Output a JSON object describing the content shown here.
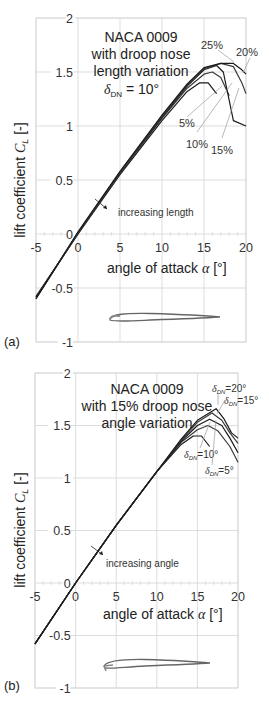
{
  "chart_data": [
    {
      "type": "line",
      "panel_label": "(a)",
      "title_lines": [
        "NACA 0009",
        "with droop nose",
        "length variation"
      ],
      "title_param": "δDN = 10°",
      "xlabel": "angle of attack α [°]",
      "ylabel": "lift coefficient CL [-]",
      "xlim": [
        -5,
        20
      ],
      "ylim": [
        -1,
        2
      ],
      "xticks": [
        "-5",
        "0",
        "5",
        "10",
        "15",
        "20"
      ],
      "yticks": [
        "2",
        "1.5",
        "1",
        "0.5",
        "0",
        "-0.5",
        "-1"
      ],
      "grid": true,
      "annotation": "increasing length",
      "series": [
        {
          "name": "5%",
          "x": [
            -5,
            0,
            5,
            10,
            13,
            14.5,
            15.5,
            16.5
          ],
          "y": [
            -0.58,
            0.0,
            0.55,
            1.05,
            1.32,
            1.4,
            1.4,
            1.3
          ]
        },
        {
          "name": "10%",
          "x": [
            -5,
            0,
            5,
            10,
            13,
            15,
            16,
            17,
            18
          ],
          "y": [
            -0.58,
            0.0,
            0.56,
            1.07,
            1.35,
            1.48,
            1.5,
            1.45,
            1.28
          ]
        },
        {
          "name": "15%",
          "x": [
            -5,
            0,
            5,
            10,
            13,
            15,
            16.5,
            17.3,
            18.5,
            20
          ],
          "y": [
            -0.59,
            0.01,
            0.57,
            1.08,
            1.37,
            1.52,
            1.56,
            1.5,
            1.05,
            1.0
          ]
        },
        {
          "name": "20%",
          "x": [
            -5,
            0,
            5,
            10,
            13,
            15,
            17,
            18.5,
            19.5,
            20
          ],
          "y": [
            -0.6,
            0.01,
            0.57,
            1.09,
            1.38,
            1.53,
            1.58,
            1.55,
            1.4,
            1.3
          ]
        },
        {
          "name": "25%",
          "x": [
            -5,
            0,
            5,
            10,
            13,
            15,
            17,
            18.5,
            19.5,
            20
          ],
          "y": [
            -0.6,
            0.02,
            0.58,
            1.1,
            1.39,
            1.54,
            1.58,
            1.58,
            1.52,
            1.48
          ]
        }
      ],
      "labels": [
        "25%",
        "20%",
        "5%",
        "10%",
        "15%"
      ]
    },
    {
      "type": "line",
      "panel_label": "(b)",
      "title_lines": [
        "NACA 0009",
        "with 15% droop nose",
        "angle variation"
      ],
      "xlabel": "angle of attack α [°]",
      "ylabel": "lift coefficient CL [-]",
      "xlim": [
        -5,
        20
      ],
      "ylim": [
        -1,
        2
      ],
      "xticks": [
        "-5",
        "0",
        "5",
        "10",
        "15",
        "20"
      ],
      "yticks": [
        "2",
        "1.5",
        "1",
        "0.5",
        "0",
        "-0.5",
        "-1"
      ],
      "grid": true,
      "annotation": "increasing angle",
      "series": [
        {
          "name": "δDN=0°",
          "x": [
            -5,
            0,
            5,
            10,
            13,
            14.5,
            15.5,
            16.5
          ],
          "y": [
            -0.58,
            0.0,
            0.55,
            1.06,
            1.32,
            1.4,
            1.4,
            1.3
          ]
        },
        {
          "name": "δDN=5°",
          "x": [
            -5,
            0,
            5,
            10,
            13,
            15,
            16.3,
            17.5,
            19,
            20
          ],
          "y": [
            -0.58,
            0.0,
            0.55,
            1.06,
            1.34,
            1.46,
            1.5,
            1.45,
            1.3,
            1.15
          ]
        },
        {
          "name": "δDN=10°",
          "x": [
            -5,
            0,
            5,
            10,
            13,
            15,
            16.5,
            18,
            19,
            20
          ],
          "y": [
            -0.58,
            0.0,
            0.55,
            1.06,
            1.35,
            1.5,
            1.56,
            1.5,
            1.38,
            1.24
          ]
        },
        {
          "name": "δDN=15°",
          "x": [
            -5,
            0,
            5,
            10,
            13,
            15,
            16.8,
            18,
            19,
            20
          ],
          "y": [
            -0.58,
            0.0,
            0.55,
            1.06,
            1.36,
            1.53,
            1.62,
            1.55,
            1.43,
            1.33
          ]
        },
        {
          "name": "δDN=20°",
          "x": [
            -5,
            0,
            5,
            10,
            13,
            15,
            17.3,
            18.3,
            19.2,
            20
          ],
          "y": [
            -0.58,
            0.0,
            0.55,
            1.06,
            1.37,
            1.55,
            1.66,
            1.56,
            1.43,
            1.38
          ]
        }
      ],
      "labels": [
        "δDN=20°",
        "δDN=15°",
        "δDN=10°",
        "δDN=5°"
      ]
    }
  ],
  "panels": {
    "a": {
      "label": "(a)",
      "title1": "NACA 0009",
      "title2": "with droop nose",
      "title3": "length variation",
      "param_sym": "δ",
      "param_sub": "DN",
      "param_val": " = 10°",
      "annotation": "increasing length",
      "lbl_25": "25%",
      "lbl_20": "20%",
      "lbl_5": "5%",
      "lbl_10": "10%",
      "lbl_15": "15%",
      "xlabel": "angle of attack ",
      "xlabel_sym": "α",
      "xlabel_unit": " [°]",
      "ylabel": "lift coefficient ",
      "ylabel_sym": "C",
      "ylabel_sub": "L",
      "ylabel_unit": " [-]",
      "xticks": [
        "-5",
        "0",
        "5",
        "10",
        "15",
        "20"
      ],
      "yticks": [
        "2",
        "1.5",
        "1",
        "0.5",
        "0",
        "-0.5",
        "-1"
      ]
    },
    "b": {
      "label": "(b)",
      "title1": "NACA 0009",
      "title2": "with 15% droop nose",
      "title3": "angle variation",
      "annotation": "increasing angle",
      "lbl_20": "=20°",
      "lbl_15": "=15°",
      "lbl_10": "=10°",
      "lbl_5": "=5°",
      "delta": "δ",
      "dn": "DN",
      "xlabel": "angle of attack ",
      "xlabel_sym": "α",
      "xlabel_unit": " [°]",
      "ylabel": "lift coefficient ",
      "ylabel_sym": "C",
      "ylabel_sub": "L",
      "ylabel_unit": " [-]",
      "xticks": [
        "-5",
        "0",
        "5",
        "10",
        "15",
        "20"
      ],
      "yticks": [
        "2",
        "1.5",
        "1",
        "0.5",
        "0",
        "-0.5",
        "-1"
      ]
    }
  },
  "colors": {
    "grid": "#d4d4d4",
    "curve_dark": "#1a1a1a",
    "curve_mid": "#555555",
    "leader": "#999999"
  }
}
